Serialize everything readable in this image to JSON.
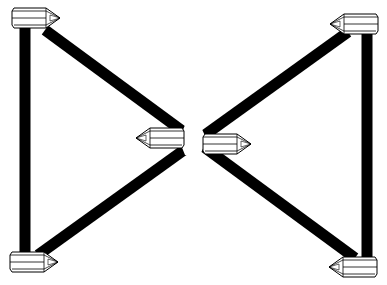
{
  "diagram": {
    "type": "crystal-grid-layout",
    "stroke_color": "#000000",
    "fill_color": "#ffffff",
    "crystals": [
      {
        "id": "top-left",
        "x": 12,
        "y": 8,
        "direction": "right"
      },
      {
        "id": "top-right",
        "x": 328,
        "y": 14,
        "direction": "left"
      },
      {
        "id": "center-left",
        "x": 135,
        "y": 128,
        "direction": "left"
      },
      {
        "id": "center-right",
        "x": 203,
        "y": 134,
        "direction": "right"
      },
      {
        "id": "bottom-left",
        "x": 10,
        "y": 252,
        "direction": "right"
      },
      {
        "id": "bottom-right",
        "x": 327,
        "y": 257,
        "direction": "left"
      }
    ],
    "connections": [
      {
        "from": "top-left",
        "to": "bottom-left"
      },
      {
        "from": "top-right",
        "to": "bottom-right"
      },
      {
        "from": "top-left",
        "to": "bottom-right"
      },
      {
        "from": "top-right",
        "to": "bottom-left"
      }
    ]
  }
}
